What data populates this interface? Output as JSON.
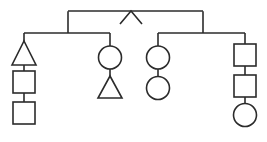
{
  "diagram": {
    "type": "pedigree-genogram",
    "background_color": "#ffffff",
    "line_color": "#2b2b2b",
    "line_width": 1.6,
    "canvas": {
      "width": 267,
      "height": 142
    },
    "shape_legend": {
      "square": "male",
      "circle": "female",
      "triangle": "unspecified-sex",
      "chevron": "generation-marker"
    },
    "top_marker": {
      "name": "chevron-up-marker",
      "points": "120,24 131,11 142,24",
      "description": "inverted-V apex marker on the top sibship line"
    },
    "lines": {
      "top_sibship_bar": {
        "x1": 68,
        "y1": 11,
        "x2": 203,
        "y2": 11
      },
      "top_left_drop": {
        "x1": 68,
        "y1": 11,
        "x2": 68,
        "y2": 33
      },
      "top_right_drop": {
        "x1": 203,
        "y1": 11,
        "x2": 203,
        "y2": 33
      },
      "left_sibship_bar": {
        "x1": 24,
        "y1": 33,
        "x2": 110,
        "y2": 33
      },
      "right_sibship_bar": {
        "x1": 158,
        "y1": 33,
        "x2": 245,
        "y2": 33
      }
    },
    "branches": [
      {
        "id": "branch-1",
        "name": "leftmost-lineage",
        "center_x": 24,
        "nodes": [
          {
            "shape": "triangle",
            "label": "unspecified",
            "cx": 24,
            "cy": 53,
            "size": 24
          },
          {
            "shape": "square",
            "label": "male",
            "cx": 24,
            "cy": 82,
            "size": 22
          },
          {
            "shape": "square",
            "label": "male",
            "cx": 24,
            "cy": 113,
            "size": 22
          }
        ]
      },
      {
        "id": "branch-2",
        "name": "second-lineage",
        "center_x": 110,
        "nodes": [
          {
            "shape": "circle",
            "label": "female",
            "cx": 110,
            "cy": 57,
            "size": 23
          },
          {
            "shape": "triangle",
            "label": "unspecified",
            "cx": 110,
            "cy": 86,
            "size": 24
          }
        ]
      },
      {
        "id": "branch-3",
        "name": "third-lineage",
        "center_x": 158,
        "nodes": [
          {
            "shape": "circle",
            "label": "female",
            "cx": 158,
            "cy": 57,
            "size": 23
          },
          {
            "shape": "circle",
            "label": "female",
            "cx": 158,
            "cy": 88,
            "size": 23
          }
        ]
      },
      {
        "id": "branch-4",
        "name": "rightmost-lineage",
        "center_x": 245,
        "nodes": [
          {
            "shape": "square",
            "label": "male",
            "cx": 245,
            "cy": 55,
            "size": 22
          },
          {
            "shape": "square",
            "label": "male",
            "cx": 245,
            "cy": 86,
            "size": 22
          },
          {
            "shape": "circle",
            "label": "female",
            "cx": 245,
            "cy": 115,
            "size": 23
          }
        ]
      }
    ]
  }
}
